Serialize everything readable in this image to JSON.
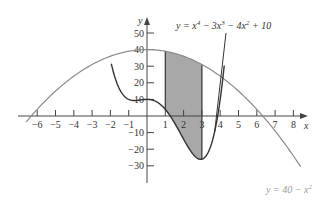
{
  "chart_data": {
    "type": "line",
    "title": "",
    "xlabel": "x",
    "ylabel": "y",
    "xlim": [
      -6.5,
      8.7
    ],
    "ylim": [
      -40,
      55
    ],
    "grid": false,
    "x_ticks": [
      -6,
      -5,
      -4,
      -3,
      -2,
      -1,
      1,
      2,
      3,
      4,
      5,
      6,
      7,
      8
    ],
    "x_tick_labels": [
      "−6",
      "−5",
      "−4",
      "−3",
      "−2",
      "−1",
      "1",
      "2",
      "3",
      "4",
      "5",
      "6",
      "7",
      "8"
    ],
    "y_ticks": [
      50,
      40,
      30,
      20,
      10,
      -10,
      -20,
      -30
    ],
    "y_tick_labels": [
      "50",
      "40",
      "30",
      "20",
      "10",
      "−10",
      "−20",
      "−30"
    ],
    "series": [
      {
        "name": "y = 40 − x²",
        "expression": "40 - x^2",
        "color": "#8a8a8a",
        "domain": [
          -6.6,
          8.4
        ]
      },
      {
        "name": "y = x⁴ − 3x³ − 4x² + 10",
        "expression": "x^4 - 3x^3 - 4x^2 + 10",
        "color": "#333333",
        "domain": [
          -1.95,
          4.22
        ]
      }
    ],
    "shaded_region": {
      "between": [
        "40 - x^2",
        "x^4 - 3x^3 - 4x^2 + 10"
      ],
      "x_from": 1,
      "x_to": 3,
      "fill": "#a8a8a8"
    },
    "annotations": [
      {
        "text_parts": [
          "y = x",
          "4",
          " − 3x",
          "3",
          " − 4x",
          "2",
          " + 10"
        ],
        "points_to_x": 3.7
      },
      {
        "text_parts": [
          "y = 40 − x",
          "2"
        ],
        "position": "bottom-right"
      }
    ]
  },
  "labels": {
    "x_axis": "x",
    "y_axis": "y",
    "quartic_eq": {
      "a": "y = x",
      "e1": "4",
      "b": " − 3x",
      "e2": "3",
      "c": " − 4x",
      "e3": "2",
      "d": " + 10"
    },
    "parabola_eq": {
      "a": "y = 40 − x",
      "e1": "2"
    }
  }
}
